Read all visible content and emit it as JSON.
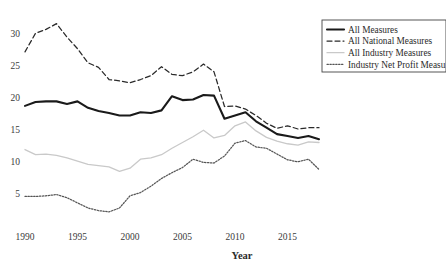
{
  "chart_data": {
    "type": "line",
    "title": "",
    "xlabel": "Year",
    "ylabel": "",
    "xlim": [
      1990,
      2018
    ],
    "ylim": [
      0,
      33
    ],
    "grid": false,
    "legend_position": "top-right",
    "xticks": [
      "1990",
      "1995",
      "2000",
      "2005",
      "2010",
      "2015"
    ],
    "xtick_values": [
      1990,
      1995,
      2000,
      2005,
      2010,
      2015
    ],
    "yticks": [
      "5",
      "10",
      "15",
      "20",
      "25",
      "30"
    ],
    "ytick_values": [
      5,
      10,
      15,
      20,
      25,
      30
    ],
    "x": [
      1990,
      1991,
      1992,
      1993,
      1994,
      1995,
      1996,
      1997,
      1998,
      1999,
      2000,
      2001,
      2002,
      2003,
      2004,
      2005,
      2006,
      2007,
      2008,
      2009,
      2010,
      2011,
      2012,
      2013,
      2014,
      2015,
      2016,
      2017,
      2018
    ],
    "series": [
      {
        "name": "All Measures",
        "style": "solid-thick",
        "color": "#1a1a1a",
        "values": [
          18.7,
          19.3,
          19.4,
          19.4,
          19.0,
          19.4,
          18.4,
          17.9,
          17.6,
          17.2,
          17.2,
          17.7,
          17.6,
          18.0,
          20.2,
          19.6,
          19.7,
          20.4,
          20.3,
          16.7,
          17.2,
          17.7,
          16.3,
          15.3,
          14.3,
          14.0,
          13.7,
          14.0,
          13.5
        ]
      },
      {
        "name": "All National Measures",
        "style": "dashed",
        "color": "#2a2a2a",
        "values": [
          27.1,
          30.0,
          30.6,
          31.5,
          29.4,
          27.6,
          25.4,
          24.7,
          22.8,
          22.6,
          22.3,
          22.8,
          23.4,
          24.8,
          23.6,
          23.4,
          24.0,
          25.2,
          24.0,
          18.6,
          18.7,
          18.2,
          17.2,
          16.0,
          15.2,
          15.6,
          15.1,
          15.3,
          15.3
        ]
      },
      {
        "name": "All Industry Measures",
        "style": "solid-light",
        "color": "#c9c9c9",
        "values": [
          11.9,
          11.1,
          11.2,
          11.0,
          10.6,
          10.1,
          9.6,
          9.4,
          9.2,
          8.5,
          9.0,
          10.4,
          10.6,
          11.1,
          12.1,
          13.0,
          13.9,
          14.9,
          13.7,
          14.1,
          15.6,
          16.2,
          14.8,
          13.8,
          13.2,
          12.8,
          12.6,
          13.1,
          13.0
        ]
      },
      {
        "name": "Industry Net Profit Measu",
        "style": "dotted",
        "color": "#555555",
        "values": [
          4.6,
          4.6,
          4.7,
          4.9,
          4.4,
          3.6,
          2.8,
          2.4,
          2.2,
          2.8,
          4.7,
          5.2,
          6.2,
          7.4,
          8.3,
          9.1,
          10.4,
          9.9,
          9.8,
          10.9,
          12.9,
          13.3,
          12.3,
          12.1,
          11.2,
          10.3,
          10.0,
          10.4,
          8.8
        ]
      }
    ],
    "legend_entries": [
      {
        "label": "All Measures",
        "style": "solid-thick"
      },
      {
        "label": "All National Measures",
        "style": "dashed"
      },
      {
        "label": "All Industry Measures",
        "style": "solid-light"
      },
      {
        "label": "Industry Net Profit Measu",
        "style": "dotted"
      }
    ]
  }
}
